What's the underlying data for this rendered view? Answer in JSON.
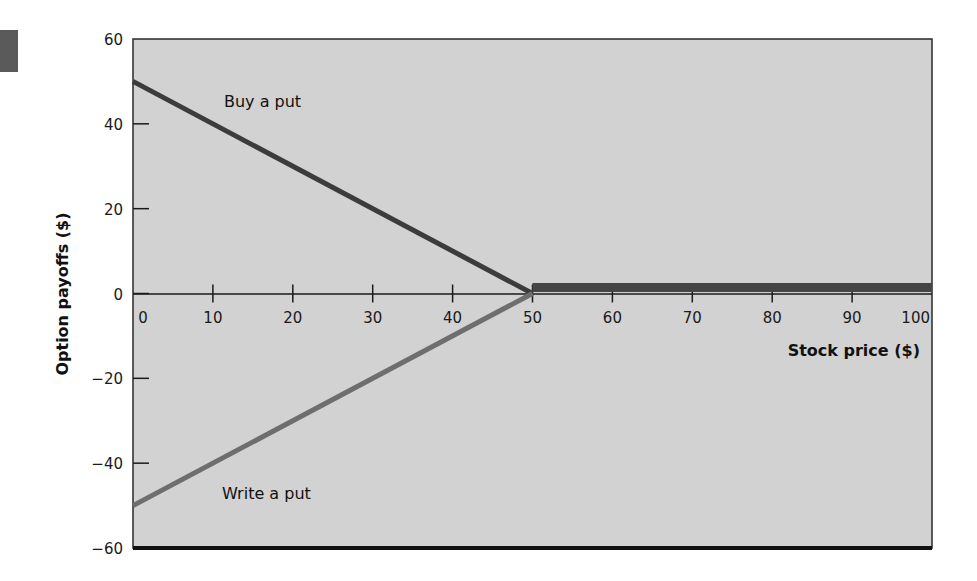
{
  "chart_data": {
    "type": "line",
    "title": "",
    "xlabel": "Stock price ($)",
    "ylabel": "Option payoffs ($)",
    "xlim": [
      0,
      100
    ],
    "ylim": [
      -60,
      60
    ],
    "x_ticks": [
      "0",
      "10",
      "20",
      "30",
      "40",
      "50",
      "60",
      "70",
      "80",
      "90",
      "100"
    ],
    "y_ticks": [
      "60",
      "40",
      "20",
      "0",
      "−20",
      "−40",
      "−60"
    ],
    "grid": false,
    "legend": null,
    "series": [
      {
        "name": "Buy a put",
        "x": [
          0,
          50,
          100
        ],
        "y": [
          50,
          0,
          0
        ],
        "color": "#3c3c3c"
      },
      {
        "name": "Write a put",
        "x": [
          0,
          50,
          100
        ],
        "y": [
          -50,
          0,
          0
        ],
        "color": "#6e6e6e"
      }
    ],
    "annotations": [
      {
        "text": "Buy a put",
        "x": 12,
        "y": 46
      },
      {
        "text": "Write a put",
        "x": 11,
        "y": -44
      }
    ],
    "colors": {
      "plot_background": "#d2d2d2",
      "axis": "#1a1a1a",
      "baseline_bottom": "#111111"
    }
  }
}
